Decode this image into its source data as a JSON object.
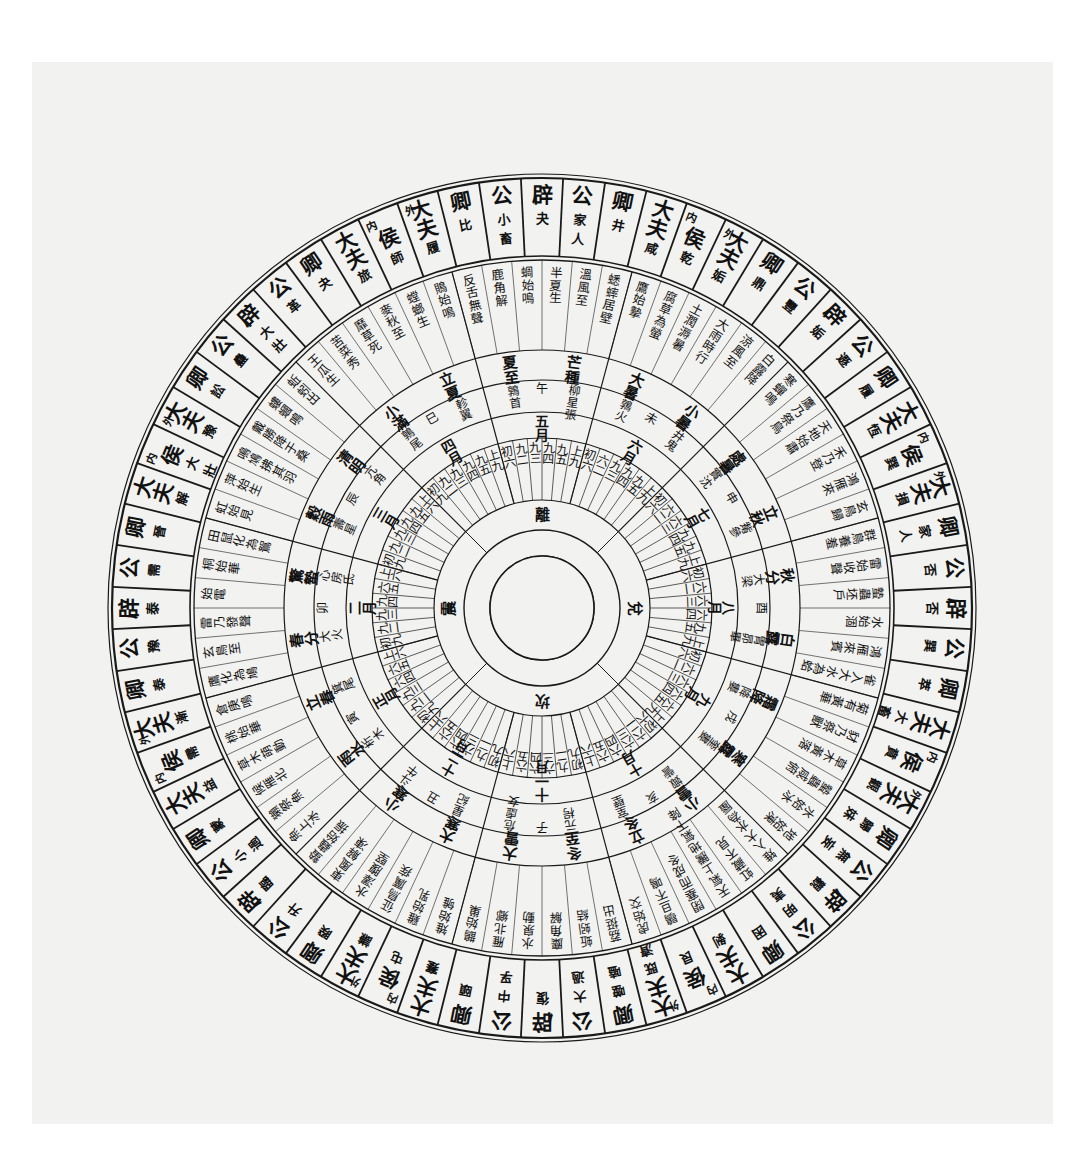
{
  "meta": {
    "subtitle": "六十四卦配二十四節氣七十二候圖",
    "background_color": "#ffffff",
    "paper_color": "#f2f2f0",
    "ink_color": "#111111",
    "center_x": 542,
    "center_y": 608,
    "radii": {
      "hub_inner": 52,
      "hub_outer": 78,
      "trigram_outer": 108,
      "yao_outer": 170,
      "month_outer": 196,
      "star_outer": 228,
      "term_outer": 258,
      "phenology_outer": 348,
      "hexagram_inner": 352,
      "hexagram_outer": 430,
      "rim": 434
    }
  },
  "chart_data": {
    "type": "pie",
    "legend": "",
    "rings": [
      {
        "name": "hub",
        "label": "空心圓 (empty center)",
        "values": []
      },
      {
        "name": "trigram_ring",
        "label": "四正卦",
        "values": [
          "坎",
          "震",
          "離",
          "兌"
        ]
      },
      {
        "name": "yao_ring",
        "label": "爻位",
        "values": []
      },
      {
        "name": "month_ring",
        "label": "十二月",
        "values": []
      },
      {
        "name": "star_ring",
        "label": "十二次・十二辰・二十八宿",
        "values": []
      },
      {
        "name": "term_ring",
        "label": "二十四節氣",
        "values": []
      },
      {
        "name": "phenology_ring",
        "label": "七十二候",
        "values": []
      },
      {
        "name": "hexagram_ring",
        "label": "六十四卦 (辟公卿大夫侯)",
        "values": []
      }
    ]
  },
  "center": {
    "label": "",
    "note": ""
  },
  "trigrams": [
    {
      "name": "坎",
      "angle": 90
    },
    {
      "name": "震",
      "angle": 180
    },
    {
      "name": "離",
      "angle": 270
    },
    {
      "name": "兌",
      "angle": 0
    }
  ],
  "months": [
    {
      "index": 1,
      "month": "十一月",
      "branch": "子",
      "ci": "元枵",
      "lodges": "危虛女",
      "term_mid": "冬至",
      "term_begin": "大雪",
      "zhengua": "復",
      "angle": 90
    },
    {
      "index": 2,
      "month": "十二月",
      "branch": "丑",
      "ci": "星紀",
      "lodges": "斗牛",
      "term_mid": "大寒",
      "term_begin": "小寒",
      "zhengua": "臨",
      "angle": 120
    },
    {
      "index": 3,
      "month": "正月",
      "branch": "寅",
      "ci": "析木",
      "lodges": "箕尾",
      "term_mid": "雨水",
      "term_begin": "立春",
      "zhengua": "泰",
      "angle": 150
    },
    {
      "index": 4,
      "month": "二月",
      "branch": "卯",
      "ci": "大火",
      "lodges": "心房氐",
      "term_mid": "春分",
      "term_begin": "驚蟄",
      "zhengua": "大壯",
      "angle": 180
    },
    {
      "index": 5,
      "month": "三月",
      "branch": "辰",
      "ci": "壽星",
      "lodges": "亢角",
      "term_mid": "穀雨",
      "term_begin": "清明",
      "zhengua": "夬",
      "angle": 210
    },
    {
      "index": 6,
      "month": "四月",
      "branch": "巳",
      "ci": "鶉尾",
      "lodges": "軫翼",
      "term_mid": "小滿",
      "term_begin": "立夏",
      "zhengua": "乾",
      "angle": 240
    },
    {
      "index": 7,
      "month": "五月",
      "branch": "午",
      "ci": "鶉首",
      "lodges": "柳星張",
      "term_mid": "夏至",
      "term_begin": "芒種",
      "zhengua": "姤",
      "angle": 270
    },
    {
      "index": 8,
      "month": "六月",
      "branch": "未",
      "ci": "鶉火",
      "lodges": "井鬼",
      "term_mid": "大暑",
      "term_begin": "小暑",
      "zhengua": "遯",
      "angle": 300
    },
    {
      "index": 9,
      "month": "七月",
      "branch": "申",
      "ci": "實沈",
      "lodges": "觜參",
      "term_mid": "處暑",
      "term_begin": "立秋",
      "zhengua": "否",
      "angle": 330
    },
    {
      "index": 10,
      "month": "八月",
      "branch": "酉",
      "ci": "大梁",
      "lodges": "胃昴畢",
      "term_mid": "秋分",
      "term_begin": "白露",
      "zhengua": "觀",
      "angle": 0
    },
    {
      "index": 11,
      "month": "九月",
      "branch": "戌",
      "ci": "降婁",
      "lodges": "奎婁",
      "term_mid": "霜降",
      "term_begin": "寒露",
      "zhengua": "剝",
      "angle": 30
    },
    {
      "index": 12,
      "month": "十月",
      "branch": "亥",
      "ci": "娵訾",
      "lodges": "室壁",
      "term_mid": "小雪",
      "term_begin": "立冬",
      "zhengua": "坤",
      "angle": 60
    }
  ],
  "yao_labels": [
    [
      "初九",
      "九二",
      "六三",
      "六四",
      "六五",
      "上六"
    ],
    [
      "初九",
      "九二",
      "六三",
      "六四",
      "六五",
      "上六"
    ],
    [
      "初九",
      "九二",
      "九三",
      "六四",
      "六五",
      "上六"
    ],
    [
      "初九",
      "九二",
      "九三",
      "九四",
      "六五",
      "上六"
    ],
    [
      "初九",
      "九二",
      "九三",
      "九四",
      "九五",
      "上六"
    ],
    [
      "初九",
      "九二",
      "九三",
      "九四",
      "九五",
      "上九"
    ],
    [
      "初六",
      "九二",
      "九三",
      "九四",
      "九五",
      "上九"
    ],
    [
      "初六",
      "六二",
      "九三",
      "九四",
      "九五",
      "上九"
    ],
    [
      "初六",
      "六二",
      "六三",
      "九四",
      "九五",
      "上九"
    ],
    [
      "初六",
      "六二",
      "六三",
      "六四",
      "九五",
      "上九"
    ],
    [
      "初六",
      "六二",
      "六三",
      "六四",
      "六五",
      "上九"
    ],
    [
      "初六",
      "六二",
      "六三",
      "六四",
      "六五",
      "上六"
    ]
  ],
  "phenology": [
    "蚯蚓結",
    "麋角解",
    "水泉動",
    "雁北鄉",
    "鵲始巢",
    "雉始雊",
    "雞始乳",
    "征鳥厲疾",
    "水澤腹堅",
    "東風解凍",
    "蟄蟲始振",
    "魚上冰",
    "獺祭魚",
    "候雁北",
    "草木萌動",
    "桃始華",
    "倉庚鳴",
    "鷹化為鳩",
    "玄鳥至",
    "雷乃發聲",
    "始電",
    "桐始華",
    "田鼠化為鴽",
    "虹始見",
    "萍始生",
    "鳴鳩拂其羽",
    "戴勝降于桑",
    "螻蟈鳴",
    "蚯蚓出",
    "王瓜生",
    "苦菜秀",
    "靡草死",
    "麥秋至",
    "螳螂生",
    "鵙始鳴",
    "反舌無聲",
    "鹿角解",
    "蜩始鳴",
    "半夏生",
    "溫風至",
    "蟋蟀居壁",
    "鷹始摯",
    "腐草為螢",
    "土潤溽暑",
    "大雨時行",
    "涼風至",
    "白露降",
    "寒蟬鳴",
    "鷹乃祭鳥",
    "天地始肅",
    "禾乃登",
    "鴻雁來",
    "玄鳥歸",
    "群鳥養羞",
    "雷始收聲",
    "蟄蟲坯戶",
    "水始涸",
    "鴻雁來賓",
    "雀入大水為蛤",
    "菊有黃華",
    "豺乃祭獸",
    "草木黃落",
    "蟄蟲咸俯",
    "水始冰",
    "地始凍",
    "雉入大水為蜃",
    "虹藏不見",
    "天氣上騰地氣下降",
    "閉塞而成冬",
    "鶡旦不鳴",
    "虎始交",
    "荔挺出"
  ],
  "hexagram_ring": [
    {
      "rank": "辟",
      "name": "復",
      "angle": 90.0
    },
    {
      "rank": "公",
      "name": "中孚",
      "angle": 95.625
    },
    {
      "rank": "卿",
      "name": "頤",
      "angle": 101.25
    },
    {
      "rank": "大夫",
      "name": "蹇",
      "angle": 106.875
    },
    {
      "rank": "內外侯",
      "name": "屯",
      "angle": 112.5
    },
    {
      "rank": "大夫",
      "name": "謙",
      "angle": 118.125
    },
    {
      "rank": "卿",
      "name": "睽",
      "angle": 123.75
    },
    {
      "rank": "公",
      "name": "升",
      "angle": 129.375
    },
    {
      "rank": "辟",
      "name": "臨",
      "angle": 135.0
    },
    {
      "rank": "公",
      "name": "小過",
      "angle": 140.625
    },
    {
      "rank": "卿",
      "name": "蒙",
      "angle": 146.25
    },
    {
      "rank": "大夫",
      "name": "益",
      "angle": 151.875
    },
    {
      "rank": "內外侯",
      "name": "需",
      "angle": 157.5
    },
    {
      "rank": "大夫",
      "name": "漸",
      "angle": 163.125
    },
    {
      "rank": "卿",
      "name": "泰",
      "angle": 168.75
    },
    {
      "rank": "公",
      "name": "豫",
      "angle": 174.375
    },
    {
      "rank": "辟",
      "name": "泰",
      "angle": 180.0
    },
    {
      "rank": "公",
      "name": "需",
      "angle": 185.625
    },
    {
      "rank": "卿",
      "name": "晉",
      "angle": 191.25
    },
    {
      "rank": "大夫",
      "name": "解",
      "angle": 196.875
    },
    {
      "rank": "內外侯",
      "name": "大壯",
      "angle": 202.5
    },
    {
      "rank": "大夫",
      "name": "豫",
      "angle": 208.125
    },
    {
      "rank": "卿",
      "name": "訟",
      "angle": 213.75
    },
    {
      "rank": "公",
      "name": "蠱",
      "angle": 219.375
    },
    {
      "rank": "辟",
      "name": "大壯",
      "angle": 225.0
    },
    {
      "rank": "公",
      "name": "革",
      "angle": 230.625
    },
    {
      "rank": "卿",
      "name": "夬",
      "angle": 236.25
    },
    {
      "rank": "大夫",
      "name": "旅",
      "angle": 241.875
    },
    {
      "rank": "內外侯",
      "name": "師",
      "angle": 247.5
    },
    {
      "rank": "大夫",
      "name": "履",
      "angle": 253.125
    },
    {
      "rank": "卿",
      "name": "比",
      "angle": 258.75
    },
    {
      "rank": "公",
      "name": "小畜",
      "angle": 264.375
    },
    {
      "rank": "辟",
      "name": "夬",
      "angle": 270.0
    },
    {
      "rank": "公",
      "name": "家人",
      "angle": 275.625
    },
    {
      "rank": "卿",
      "name": "井",
      "angle": 281.25
    },
    {
      "rank": "大夫",
      "name": "咸",
      "angle": 286.875
    },
    {
      "rank": "內外侯",
      "name": "乾",
      "angle": 292.5
    },
    {
      "rank": "大夫",
      "name": "姤",
      "angle": 298.125
    },
    {
      "rank": "卿",
      "name": "鼎",
      "angle": 303.75
    },
    {
      "rank": "公",
      "name": "豐",
      "angle": 309.375
    },
    {
      "rank": "辟",
      "name": "姤",
      "angle": 315.0
    },
    {
      "rank": "公",
      "name": "遯",
      "angle": 320.625
    },
    {
      "rank": "卿",
      "name": "履",
      "angle": 326.25
    },
    {
      "rank": "大夫",
      "name": "恆",
      "angle": 331.875
    },
    {
      "rank": "內外侯",
      "name": "巽",
      "angle": 337.5
    },
    {
      "rank": "大夫",
      "name": "損",
      "angle": 343.125
    },
    {
      "rank": "卿",
      "name": "家人",
      "angle": 348.75
    },
    {
      "rank": "公",
      "name": "否",
      "angle": 354.375
    },
    {
      "rank": "辟",
      "name": "否",
      "angle": 0.0
    },
    {
      "rank": "公",
      "name": "巽",
      "angle": 5.625
    },
    {
      "rank": "卿",
      "name": "萃",
      "angle": 11.25
    },
    {
      "rank": "大夫",
      "name": "大畜",
      "angle": 16.875
    },
    {
      "rank": "內外侯",
      "name": "賁",
      "angle": 22.5
    },
    {
      "rank": "大夫",
      "name": "觀",
      "angle": 28.125
    },
    {
      "rank": "卿",
      "name": "歸妹",
      "angle": 33.75
    },
    {
      "rank": "公",
      "name": "無妄",
      "angle": 39.375
    },
    {
      "rank": "辟",
      "name": "觀",
      "angle": 45.0
    },
    {
      "rank": "公",
      "name": "明夷",
      "angle": 50.625
    },
    {
      "rank": "卿",
      "name": "困",
      "angle": 56.25
    },
    {
      "rank": "大夫",
      "name": "剝",
      "angle": 61.875
    },
    {
      "rank": "內外侯",
      "name": "艮",
      "angle": 67.5
    },
    {
      "rank": "大夫",
      "name": "既濟",
      "angle": 73.125
    },
    {
      "rank": "卿",
      "name": "噬嗑",
      "angle": 78.75
    },
    {
      "rank": "公",
      "name": "大過",
      "angle": 84.375
    }
  ],
  "hexagram_ring_read": {
    "note": "讀序 (自子位起逆時針): 辟復・公中孚・卿頤・大夫蹇・內外侯屯・大夫謙・卿睽・公升・辟臨・公小過・卿蒙・大夫益・內外侯需・大夫漸・卿泰・公豫・辟泰 …"
  }
}
